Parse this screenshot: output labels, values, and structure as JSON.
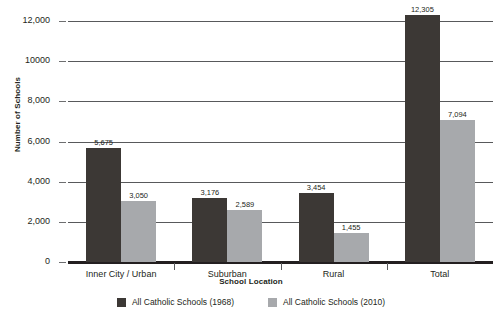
{
  "chart_data": {
    "type": "bar",
    "title": "",
    "xlabel": "School Location",
    "ylabel": "Number of Schools",
    "categories": [
      "Inner City / Urban",
      "Suburban",
      "Rural",
      "Total"
    ],
    "series": [
      {
        "name": "All Catholic Schools (1968)",
        "color": "#3c3835",
        "values": [
          5675,
          3176,
          3454,
          12305
        ],
        "labels": [
          "5,675",
          "3,176",
          "3,454",
          "12,305"
        ]
      },
      {
        "name": "All Catholic Schools (2010)",
        "color": "#a7a9ac",
        "values": [
          3050,
          2589,
          1455,
          7094
        ],
        "labels": [
          "3,050",
          "2,589",
          "1,455",
          "7,094"
        ]
      }
    ],
    "ylim": [
      0,
      12000
    ],
    "yticks": [
      0,
      2000,
      4000,
      6000,
      8000,
      10000,
      12000
    ],
    "ytick_labels": [
      "0",
      "2,000",
      "4,000",
      "6,000",
      "8,000",
      "10000",
      "12,000"
    ],
    "grid": true,
    "legend_position": "bottom"
  }
}
